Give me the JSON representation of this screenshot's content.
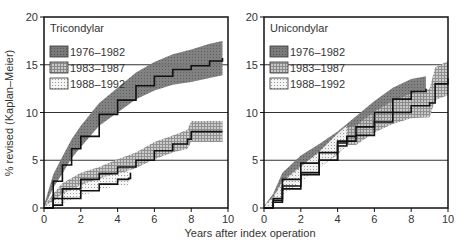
{
  "figure": {
    "ylabel": "% revised (Kaplan–Meier)",
    "xlabel": "Years after index operation"
  },
  "colors": {
    "p1": "#6e6e6e",
    "p2": "#a8a8a8",
    "p3": "#d8d8d8",
    "line": "#111111",
    "grid": "#333333"
  },
  "chart_data": [
    {
      "type": "line",
      "title": "Tricondylar",
      "xlabel": "Years after index operation",
      "ylabel": "% revised (Kaplan–Meier)",
      "xlim": [
        0,
        10
      ],
      "ylim": [
        0,
        20
      ],
      "xticks": [
        "0",
        "2",
        "4",
        "6",
        "8",
        "10"
      ],
      "yticks": [
        "0",
        "5",
        "10",
        "15",
        "20"
      ],
      "grid": "horizontal at 5, 10, 15",
      "legend_position": "upper left",
      "series": [
        {
          "name": "1976–1982",
          "band": "dark",
          "x": [
            0,
            0.5,
            1,
            1.5,
            2,
            3,
            4,
            5,
            6,
            7,
            8,
            9,
            9.7
          ],
          "y": [
            0,
            2.8,
            4.5,
            6.2,
            7.5,
            9.8,
            11.3,
            12.8,
            13.8,
            14.5,
            14.9,
            15.4,
            15.7
          ],
          "ci_halfwidth": [
            0.3,
            0.7,
            0.9,
            1.0,
            1.1,
            1.2,
            1.3,
            1.4,
            1.5,
            1.6,
            1.7,
            1.8,
            1.8
          ]
        },
        {
          "name": "1983–1987",
          "band": "medium",
          "x": [
            0,
            0.5,
            1,
            2,
            3,
            4,
            5,
            6,
            7,
            7.8,
            8,
            9.7
          ],
          "y": [
            0,
            1.0,
            2.0,
            3.0,
            3.6,
            4.3,
            5.0,
            6.0,
            6.7,
            7.2,
            8.0,
            8.0
          ],
          "ci_halfwidth": [
            0.2,
            0.5,
            0.6,
            0.7,
            0.7,
            0.8,
            0.8,
            0.9,
            0.9,
            1.0,
            1.1,
            1.1
          ]
        },
        {
          "name": "1988–1992",
          "band": "light",
          "x": [
            0,
            0.5,
            1,
            2,
            3,
            4,
            4.6,
            4.7
          ],
          "y": [
            0,
            0.3,
            1.0,
            1.8,
            2.5,
            3.0,
            3.1,
            3.7
          ],
          "ci_halfwidth": [
            0.2,
            0.4,
            0.5,
            0.6,
            0.6,
            0.7,
            0.7,
            0.8
          ]
        }
      ]
    },
    {
      "type": "line",
      "title": "Unicondylar",
      "xlabel": "Years after index operation",
      "ylabel": "",
      "xlim": [
        0,
        10
      ],
      "ylim": [
        0,
        20
      ],
      "xticks": [
        "0",
        "2",
        "4",
        "6",
        "8",
        "10"
      ],
      "yticks": [
        "0",
        "5",
        "10",
        "15",
        "20"
      ],
      "grid": "horizontal at 5, 10, 15",
      "legend_position": "upper left",
      "series": [
        {
          "name": "1976–1982",
          "band": "dark",
          "x": [
            0,
            0.5,
            1,
            2,
            3,
            4,
            5,
            6,
            7,
            8,
            8.8
          ],
          "y": [
            0,
            1.0,
            3.0,
            4.7,
            5.8,
            7.0,
            8.5,
            10.0,
            11.4,
            12.2,
            12.5
          ],
          "ci_halfwidth": [
            0.2,
            0.5,
            0.7,
            0.8,
            0.9,
            1.0,
            1.1,
            1.2,
            1.2,
            1.3,
            1.3
          ]
        },
        {
          "name": "1983–1987",
          "band": "medium",
          "x": [
            0,
            0.5,
            1,
            2,
            3,
            4,
            4.5,
            5,
            6,
            7,
            8,
            9,
            9.3,
            10
          ],
          "y": [
            0,
            0.8,
            2.3,
            3.7,
            5.0,
            6.5,
            7.5,
            7.6,
            9.0,
            10.0,
            10.7,
            11.0,
            13.0,
            13.6
          ],
          "ci_halfwidth": [
            0.2,
            0.4,
            0.6,
            0.7,
            0.8,
            0.9,
            0.9,
            1.0,
            1.1,
            1.2,
            1.3,
            1.5,
            1.7,
            1.8
          ]
        },
        {
          "name": "1988–1992",
          "band": "light",
          "x": [
            0,
            0.5,
            1,
            2,
            3,
            4,
            4.5
          ],
          "y": [
            0,
            0.6,
            2.0,
            3.5,
            5.0,
            6.8,
            7.5
          ],
          "ci_halfwidth": [
            0.2,
            0.5,
            0.7,
            0.8,
            0.9,
            1.0,
            1.1
          ]
        }
      ]
    }
  ]
}
